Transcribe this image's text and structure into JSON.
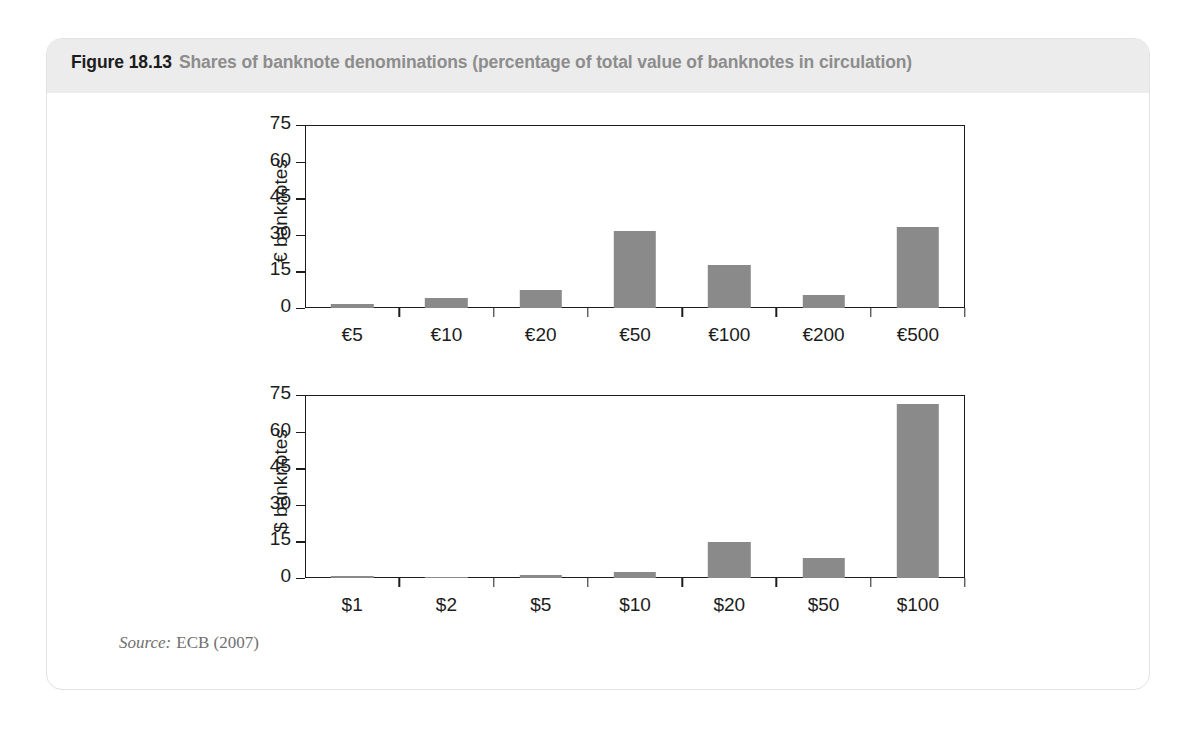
{
  "figure": {
    "number": "Figure 18.13",
    "title": "Shares of banknote denominations (percentage of total value of banknotes in circulation)",
    "source_label": "Source:",
    "source_value": "ECB (2007)"
  },
  "colors": {
    "bar": "#8a8a8a",
    "axis": "#1c1c1c",
    "caption_band": "#ececec",
    "caption_title": "#8d8d8d",
    "card_border": "#e2e2e2",
    "source_text": "#6f6f6f"
  },
  "chart_data": [
    {
      "type": "bar",
      "id": "euro",
      "title": "",
      "xlabel": "",
      "ylabel": "€ banknotes",
      "categories": [
        "€5",
        "€10",
        "€20",
        "€50",
        "€100",
        "€200",
        "€500"
      ],
      "values": [
        1.5,
        4.2,
        7.5,
        31.5,
        17.5,
        5.5,
        33.0
      ],
      "ylim": [
        0,
        75
      ],
      "yticks": [
        0,
        15,
        30,
        45,
        60,
        75
      ],
      "ytick_labels": [
        "0",
        "15",
        "30",
        "45",
        "60",
        "75"
      ],
      "grid": false,
      "legend": "none"
    },
    {
      "type": "bar",
      "id": "dollar",
      "title": "",
      "xlabel": "",
      "ylabel": "$ banknotes",
      "categories": [
        "$1",
        "$2",
        "$5",
        "$10",
        "$20",
        "$50",
        "$100"
      ],
      "values": [
        1.0,
        0.2,
        1.1,
        2.5,
        14.8,
        8.0,
        71.5
      ],
      "ylim": [
        0,
        75
      ],
      "yticks": [
        0,
        15,
        30,
        45,
        60,
        75
      ],
      "ytick_labels": [
        "0",
        "15",
        "30",
        "45",
        "60",
        "75"
      ],
      "grid": false,
      "legend": "none"
    }
  ]
}
